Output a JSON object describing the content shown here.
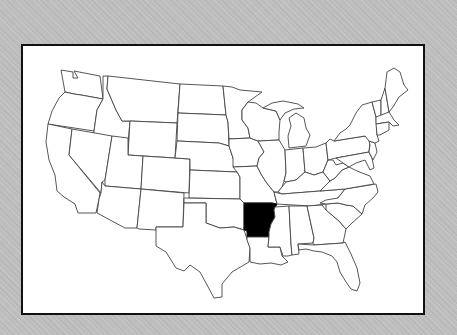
{
  "map": {
    "type": "us-states-outline",
    "highlighted_state": "Arkansas",
    "highlight_color": "#000000",
    "state_fill": "#ffffff",
    "border_color": "#444444",
    "frame_color": "#111111",
    "background_color": "#bdbdbd"
  }
}
